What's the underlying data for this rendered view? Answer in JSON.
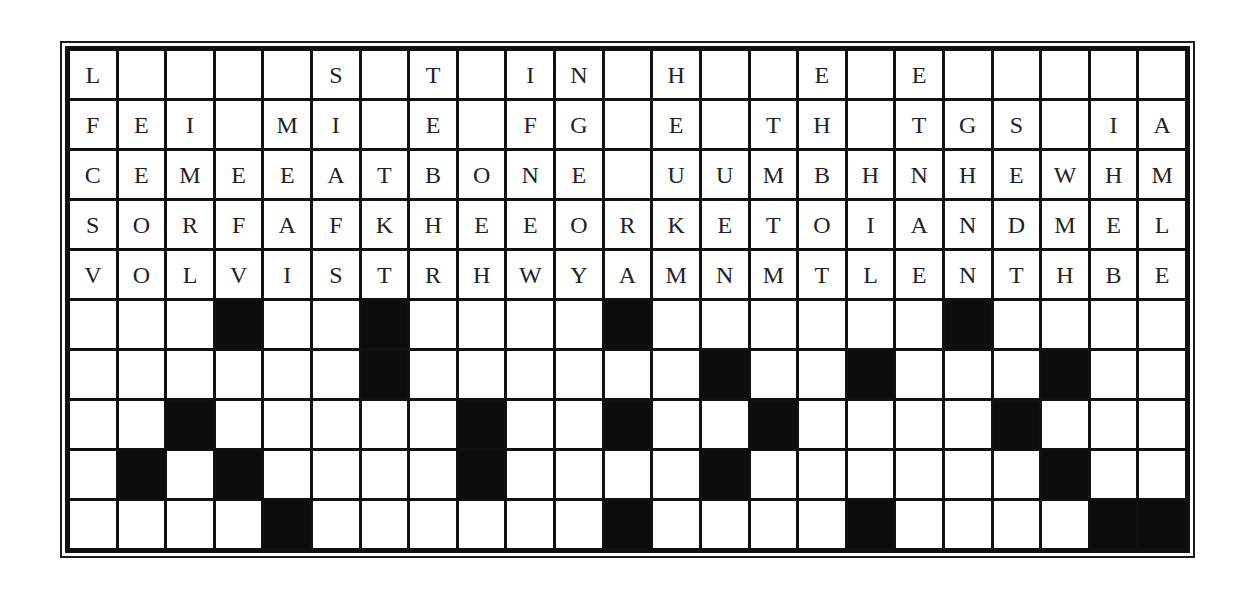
{
  "puzzle": {
    "columns": 23,
    "rows": 10,
    "letter_rows": [
      [
        "L",
        "",
        "",
        "",
        "",
        "S",
        "",
        "T",
        "",
        "I",
        "N",
        "",
        "H",
        "",
        "",
        "E",
        "",
        "E",
        "",
        "",
        "",
        "",
        ""
      ],
      [
        "F",
        "E",
        "I",
        "",
        "M",
        "I",
        "",
        "E",
        "",
        "F",
        "G",
        "",
        "E",
        "",
        "T",
        "H",
        "",
        "T",
        "G",
        "S",
        "",
        "I",
        "A"
      ],
      [
        "C",
        "E",
        "M",
        "E",
        "E",
        "A",
        "T",
        "B",
        "O",
        "N",
        "E",
        "",
        "U",
        "U",
        "M",
        "B",
        "H",
        "N",
        "H",
        "E",
        "W",
        "H",
        "M"
      ],
      [
        "S",
        "O",
        "R",
        "F",
        "A",
        "F",
        "K",
        "H",
        "E",
        "E",
        "O",
        "R",
        "K",
        "E",
        "T",
        "O",
        "I",
        "A",
        "N",
        "D",
        "M",
        "E",
        "L"
      ],
      [
        "V",
        "O",
        "L",
        "V",
        "I",
        "S",
        "T",
        "R",
        "H",
        "W",
        "Y",
        "A",
        "M",
        "N",
        "M",
        "T",
        "L",
        "E",
        "N",
        "T",
        "H",
        "B",
        "E"
      ]
    ],
    "answer_rows": [
      [
        0,
        0,
        0,
        1,
        0,
        0,
        1,
        0,
        0,
        0,
        0,
        1,
        0,
        0,
        0,
        0,
        0,
        0,
        1,
        0,
        0,
        0,
        0
      ],
      [
        0,
        0,
        0,
        0,
        0,
        0,
        1,
        0,
        0,
        0,
        0,
        0,
        0,
        1,
        0,
        0,
        1,
        0,
        0,
        0,
        1,
        0,
        0
      ],
      [
        0,
        0,
        1,
        0,
        0,
        0,
        0,
        0,
        1,
        0,
        0,
        1,
        0,
        0,
        1,
        0,
        0,
        0,
        0,
        1,
        0,
        0,
        0
      ],
      [
        0,
        1,
        0,
        1,
        0,
        0,
        0,
        0,
        1,
        0,
        0,
        0,
        0,
        1,
        0,
        0,
        0,
        0,
        0,
        0,
        1,
        0,
        0
      ],
      [
        0,
        0,
        0,
        0,
        1,
        0,
        0,
        0,
        0,
        0,
        0,
        1,
        0,
        0,
        0,
        0,
        1,
        0,
        0,
        0,
        0,
        1,
        1
      ]
    ],
    "colors": {
      "grid_line": "#111111",
      "cell_background": "#ffffff",
      "black_square": "#0d0d0d",
      "letter": "#222222"
    }
  }
}
